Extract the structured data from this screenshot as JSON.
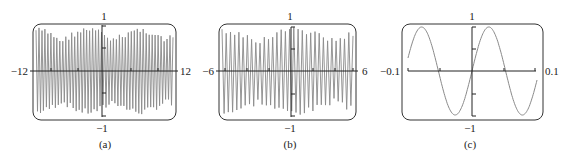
{
  "figure": {
    "panels": [
      {
        "id": "a",
        "caption": "(a)",
        "xmin_label": "−12",
        "xmax_label": "12",
        "ymax_label": "1",
        "ymin_label": "−1"
      },
      {
        "id": "b",
        "caption": "(b)",
        "xmin_label": "−6",
        "xmax_label": "6",
        "ymax_label": "1",
        "ymin_label": "−1"
      },
      {
        "id": "c",
        "caption": "(c)",
        "xmin_label": "−0.1",
        "xmax_label": "0.1",
        "ymax_label": "1",
        "ymin_label": "−1"
      }
    ],
    "colors": {
      "curve": "#8a8a8a",
      "axis": "#222222",
      "frame": "#333333"
    }
  },
  "chart_data": [
    {
      "type": "line",
      "title": "(a)",
      "xlabel": "",
      "ylabel": "",
      "xlim": [
        -12,
        12
      ],
      "ylim": [
        -1,
        1
      ],
      "x_ticks": [
        -12,
        -8,
        -4,
        0,
        4,
        8,
        12
      ],
      "y_ticks": [
        -1,
        -0.5,
        0.5,
        1
      ],
      "description": "High-frequency oscillation aliased on graphing calculator window; dense vertical strokes filling -1..1",
      "series": [
        {
          "name": "y",
          "frequency_cycles_in_window": "aliased (~40 visible strokes)"
        }
      ],
      "grid": false
    },
    {
      "type": "line",
      "title": "(b)",
      "xlabel": "",
      "ylabel": "",
      "xlim": [
        -6,
        6
      ],
      "ylim": [
        -1,
        1
      ],
      "x_ticks": [
        -6,
        -4,
        -2,
        0,
        2,
        4,
        6
      ],
      "y_ticks": [
        -1,
        -0.5,
        0.5,
        1
      ],
      "description": "Same function on narrower window; still aliased dense oscillation",
      "series": [
        {
          "name": "y",
          "frequency_cycles_in_window": "aliased (~30 visible strokes)"
        }
      ],
      "grid": false
    },
    {
      "type": "line",
      "title": "(c)",
      "xlabel": "",
      "ylabel": "",
      "xlim": [
        -0.1,
        0.1
      ],
      "ylim": [
        -1,
        1
      ],
      "x_ticks": [
        -0.1,
        -0.05,
        0,
        0.05,
        0.1
      ],
      "y_ticks": [
        -1,
        -0.5,
        0.5,
        1
      ],
      "description": "Zoomed window reveals smooth sine wave, about 2 full periods over [-0.1,0.1], passing through origin increasing",
      "series": [
        {
          "name": "y = sin(kx)",
          "x": [
            -0.1,
            -0.075,
            -0.05,
            -0.025,
            0,
            0.025,
            0.05,
            0.075,
            0.1
          ],
          "approx_period": 0.1
        }
      ],
      "grid": false
    }
  ]
}
